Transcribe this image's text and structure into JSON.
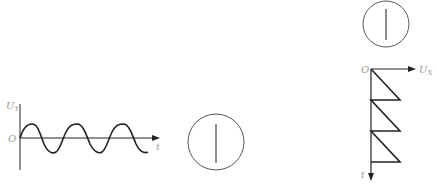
{
  "figure_left": {
    "y_axis_label": "U",
    "y_axis_sub": "Y",
    "origin_label": "O",
    "x_axis_label": "t",
    "waveform": "sine",
    "cycles": 2.7
  },
  "screen_middle": {
    "shape": "circle",
    "trace": "vertical-line"
  },
  "screen_top_right": {
    "shape": "circle",
    "trace": "vertical-line"
  },
  "figure_right": {
    "origin_label": "O",
    "x_axis_label": "U",
    "x_axis_sub": "X",
    "y_axis_label": "t",
    "waveform": "sawtooth",
    "teeth": 3
  },
  "colors": {
    "stroke": "#222222",
    "label": "#9a9a9a",
    "circle": "#555555"
  }
}
